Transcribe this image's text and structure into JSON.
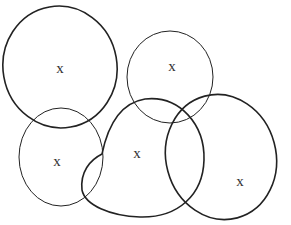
{
  "diagram": {
    "type": "overlapping-ellipses",
    "stroke_color": "#222222",
    "background": "#ffffff",
    "regions": [
      {
        "id": "top-left",
        "label": "x",
        "cx": 60,
        "cy": 67,
        "rx": 57,
        "ry": 61,
        "rotate": -10,
        "weight": "thick",
        "label_x": 60,
        "label_y": 68
      },
      {
        "id": "top-right",
        "label": "x",
        "cx": 170,
        "cy": 77,
        "rx": 43,
        "ry": 46,
        "rotate": 0,
        "weight": "thin",
        "label_x": 172,
        "label_y": 66
      },
      {
        "id": "bottom-left",
        "label": "x",
        "cx": 61,
        "cy": 157,
        "rx": 42,
        "ry": 49,
        "rotate": 0,
        "weight": "thin",
        "label_x": 57,
        "label_y": 161
      },
      {
        "id": "middle",
        "label": "x",
        "cx": 140,
        "cy": 159,
        "rx": 64,
        "ry": 60,
        "rotate": -15,
        "weight": "thick",
        "label_x": 137,
        "label_y": 153
      },
      {
        "id": "bottom-right",
        "label": "x",
        "cx": 221,
        "cy": 157,
        "rx": 56,
        "ry": 63,
        "rotate": -15,
        "weight": "thick",
        "label_x": 240,
        "label_y": 181
      }
    ],
    "inner_arc": {
      "from_x": 102,
      "from_y": 154,
      "to_x": 84,
      "to_y": 197
    }
  }
}
